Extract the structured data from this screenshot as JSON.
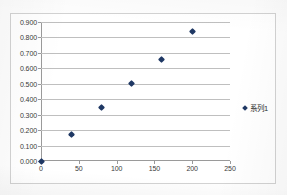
{
  "chart_data": {
    "type": "scatter",
    "title": "",
    "xlabel": "",
    "ylabel": "",
    "xlim": [
      0,
      250
    ],
    "ylim": [
      0.0,
      0.9
    ],
    "grid": "horizontal",
    "legend_position": "right",
    "marker": "diamond",
    "marker_color": "#1F3864",
    "x_ticks": [
      "0",
      "50",
      "100",
      "150",
      "200",
      "250"
    ],
    "x_tick_values": [
      0,
      50,
      100,
      150,
      200,
      250
    ],
    "y_ticks": [
      "0.000",
      "0.100",
      "0.200",
      "0.300",
      "0.400",
      "0.500",
      "0.600",
      "0.700",
      "0.800",
      "0.900"
    ],
    "y_tick_values": [
      0.0,
      0.1,
      0.2,
      0.3,
      0.4,
      0.5,
      0.6,
      0.7,
      0.8,
      0.9
    ],
    "series": [
      {
        "name": "系列1",
        "x": [
          0,
          40,
          80,
          120,
          160,
          200
        ],
        "values": [
          0.0,
          0.17,
          0.345,
          0.505,
          0.66,
          0.84
        ]
      }
    ]
  },
  "legend": {
    "entries": [
      {
        "label": "系列1",
        "color": "#1F3864"
      }
    ]
  }
}
